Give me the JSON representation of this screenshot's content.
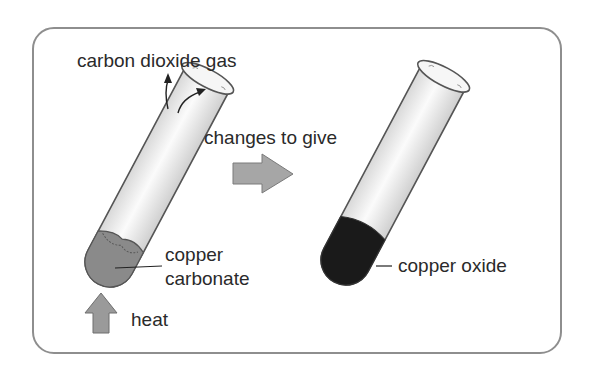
{
  "diagram": {
    "labels": {
      "gas": "carbon dioxide gas",
      "transition": "changes to give",
      "reactant_line1": "copper",
      "reactant_line2": "carbonate",
      "heat": "heat",
      "product": "copper oxide"
    },
    "colors": {
      "border": "#8e8e8e",
      "copper_carbonate": "#8a8a8a",
      "copper_oxide": "#1a1a1a",
      "arrow_fill": "#a6a6a6",
      "tube_glass": "#efefef",
      "text": "#2a2a2a"
    }
  }
}
